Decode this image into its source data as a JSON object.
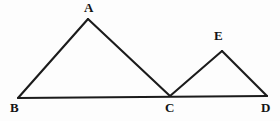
{
  "figure": {
    "kind": "geometry-diagram",
    "background_color": "#fdfdfd",
    "stroke_color": "#1b1b1b",
    "label_color": "#141414",
    "points": [
      {
        "id": "A",
        "label": "A",
        "x": 88,
        "y": 19
      },
      {
        "id": "B",
        "label": "B",
        "x": 18,
        "y": 98
      },
      {
        "id": "C",
        "label": "C",
        "x": 170,
        "y": 96
      },
      {
        "id": "D",
        "label": "D",
        "x": 267,
        "y": 96
      },
      {
        "id": "E",
        "label": "E",
        "x": 222,
        "y": 51
      }
    ],
    "segments": [
      {
        "id": "BA",
        "from": "B",
        "to": "A"
      },
      {
        "id": "AC",
        "from": "A",
        "to": "C"
      },
      {
        "id": "BD",
        "from": "B",
        "to": "D"
      },
      {
        "id": "CE",
        "from": "C",
        "to": "E"
      },
      {
        "id": "ED",
        "from": "E",
        "to": "D"
      }
    ],
    "labels": {
      "A": "A",
      "B": "B",
      "C": "C",
      "D": "D",
      "E": "E"
    }
  }
}
